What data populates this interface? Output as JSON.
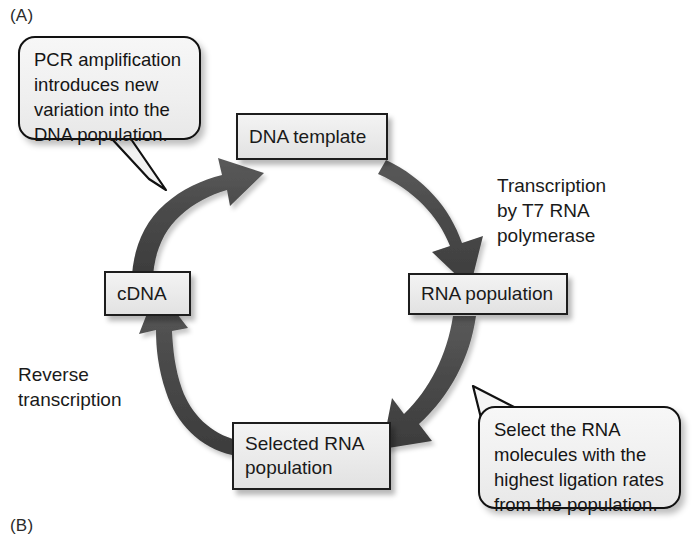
{
  "figure": {
    "panels": [
      {
        "id": "A",
        "label": "(A)"
      },
      {
        "id": "B",
        "label": "(B)"
      }
    ]
  },
  "diagram": {
    "type": "cycle-flowchart",
    "nodes": [
      {
        "id": "dna-template",
        "label": "DNA template"
      },
      {
        "id": "rna-population",
        "label": "RNA population"
      },
      {
        "id": "selected-rna",
        "label": "Selected RNA\npopulation"
      },
      {
        "id": "cdna",
        "label": "cDNA"
      }
    ],
    "edge_labels": [
      {
        "id": "transcription",
        "label": "Transcription\nby T7 RNA\npolymerase",
        "from": "dna-template",
        "to": "rna-population"
      },
      {
        "id": "reverse-transcription",
        "label": "Reverse\ntranscription",
        "from": "selected-rna",
        "to": "cdna"
      }
    ],
    "callouts": [
      {
        "id": "pcr",
        "label": "PCR amplification\nintroduces new\nvariation into the\nDNA population.",
        "points_to": "cdna-to-dna-template-arrow"
      },
      {
        "id": "select",
        "label": "Select the RNA\nmolecules with the\nhighest ligation rates\nfrom the population.",
        "points_to": "rna-population-to-selected-rna-arrow"
      }
    ],
    "arrows": [
      {
        "id": "dna-to-rna",
        "from": "dna-template",
        "to": "rna-population"
      },
      {
        "id": "rna-to-selected",
        "from": "rna-population",
        "to": "selected-rna"
      },
      {
        "id": "selected-to-cdna",
        "from": "selected-rna",
        "to": "cdna"
      },
      {
        "id": "cdna-to-dna",
        "from": "cdna",
        "to": "dna-template"
      }
    ]
  },
  "colors": {
    "background": "#ffffff",
    "arrow": "#474747",
    "box_fill": "#ececec",
    "box_border": "#1d1d1d",
    "text": "#1a1a1a"
  }
}
